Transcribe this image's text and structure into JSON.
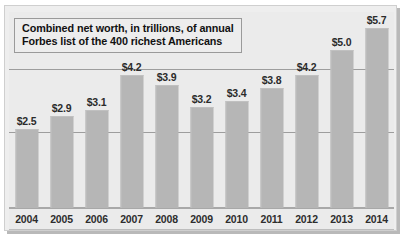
{
  "chart_data": {
    "type": "bar",
    "title": "Combined net worth, in trillions, of annual Forbes list of the 400 richest Americans",
    "title_lines": [
      "Combined net worth, in trillions, of annual",
      "Forbes list of the 400 richest Americans"
    ],
    "xlabel": "",
    "ylabel": "",
    "categories": [
      "2004",
      "2005",
      "2006",
      "2007",
      "2008",
      "2009",
      "2010",
      "2011",
      "2012",
      "2013",
      "2014"
    ],
    "values": [
      2.5,
      2.9,
      3.1,
      4.2,
      3.9,
      3.2,
      3.4,
      3.8,
      4.2,
      5.0,
      5.7
    ],
    "value_labels": [
      "$2.5",
      "$2.9",
      "$3.1",
      "$4.2",
      "$3.9",
      "$3.2",
      "$3.4",
      "$3.8",
      "$4.2",
      "$5.0",
      "$5.7"
    ],
    "ylim": [
      0,
      6.2
    ],
    "grid": true,
    "gridline_values": [
      4.4,
      2.4
    ],
    "legend": "none",
    "legend_position": "none",
    "bar_color": "#b6b6b6",
    "background_color": "#ebebeb",
    "gridline_color": "#9d9d9d",
    "text_color": "#2b2b2b"
  }
}
